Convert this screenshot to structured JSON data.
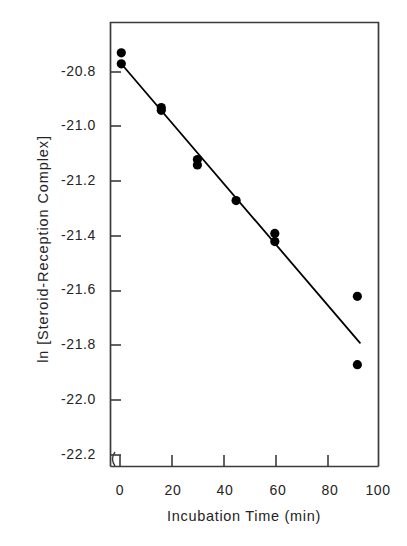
{
  "chart_data": {
    "type": "scatter",
    "title": "",
    "xlabel": "Incubation Time (min)",
    "ylabel": "ln [Steroid-Reception Complex]",
    "xlim": [
      0,
      100
    ],
    "ylim": [
      -22.3,
      -20.62
    ],
    "grid": false,
    "legend": null,
    "xticks": [
      0,
      20,
      40,
      60,
      80,
      100
    ],
    "xtick_labels": [
      "0",
      "20",
      "40",
      "60",
      "80",
      "100"
    ],
    "yticks": [
      -20.8,
      -21.0,
      -21.2,
      -21.4,
      -21.6,
      -21.8,
      -22.0,
      -22.2
    ],
    "ytick_labels": [
      "-20.8",
      "-21.0",
      "-21.2",
      "-21.4",
      "-21.6",
      "-21.8",
      "-22.0",
      "-22.2"
    ],
    "series": [
      {
        "name": "Steroid-receptor complex decay",
        "marker": "filled-circle",
        "color": "#000000",
        "points": [
          {
            "x": 0.5,
            "y": -20.73
          },
          {
            "x": 0.5,
            "y": -20.77
          },
          {
            "x": 16.0,
            "y": -20.93
          },
          {
            "x": 16.0,
            "y": -20.94
          },
          {
            "x": 30.0,
            "y": -21.12
          },
          {
            "x": 30.0,
            "y": -21.14
          },
          {
            "x": 45.0,
            "y": -21.27
          },
          {
            "x": 60.0,
            "y": -21.39
          },
          {
            "x": 60.0,
            "y": -21.42
          },
          {
            "x": 92.0,
            "y": -21.62
          },
          {
            "x": 92.0,
            "y": -21.87
          }
        ]
      },
      {
        "name": "Linear regression fit",
        "marker": "none",
        "color": "#000000",
        "line": {
          "x0": 0.5,
          "y0": -20.77,
          "x1": 93.0,
          "y1": -21.79
        }
      }
    ]
  },
  "axes": {
    "frame_color": "#3b3b3b",
    "tick_color": "#3b3b3b"
  }
}
